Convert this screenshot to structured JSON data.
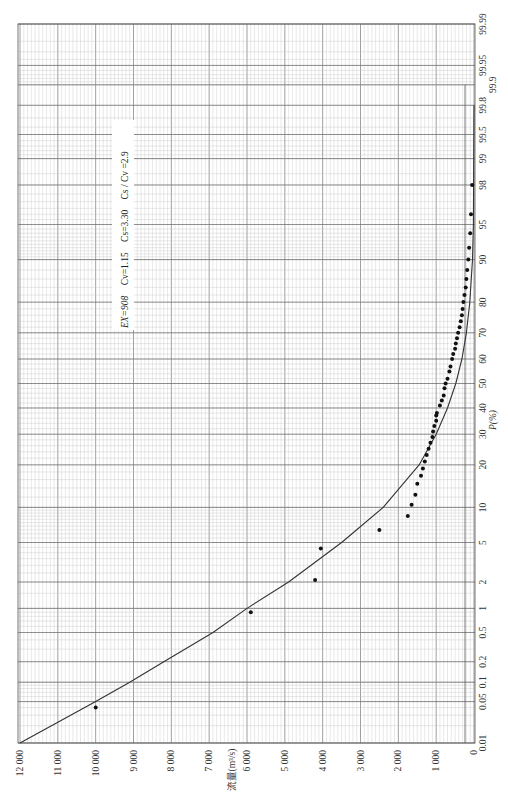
{
  "chart_data": {
    "type": "scatter",
    "title": "",
    "orientation": "rotated-90",
    "xlabel": "P(%)",
    "ylabel": "流量(m³/s)",
    "x_scale": "normal-probability",
    "x_ticks": [
      "0.01",
      "0.05",
      "0.1",
      "0.2",
      "0.5",
      "1",
      "2",
      "5",
      "10",
      "20",
      "30",
      "40",
      "50",
      "60",
      "70",
      "80",
      "90",
      "95",
      "98",
      "99",
      "99.5",
      "99.8",
      "99.9",
      "99.95",
      "99.99"
    ],
    "y_ticks": [
      "0",
      "1 000",
      "2 000",
      "3 000",
      "4 000",
      "5 000",
      "6 000",
      "7 000",
      "8 000",
      "9 000",
      "10 000",
      "11 000",
      "12 000"
    ],
    "ylim": [
      0,
      12000
    ],
    "xlim": [
      0.01,
      99.99
    ],
    "grid": true,
    "annotation": {
      "ex": "EX=908",
      "cv": "Cv=1.15",
      "cs": "Cs=3.30",
      "ratio": "Cs / Cv =2.9"
    },
    "series": [
      {
        "name": "observed",
        "kind": "points",
        "x": [
          0.04,
          0.9,
          2.1,
          4.4,
          6.5,
          8.5,
          10.5,
          12.5,
          15,
          17,
          19,
          21,
          23,
          25,
          27,
          29,
          31,
          33,
          35,
          37,
          38,
          41,
          43,
          45,
          48,
          50,
          52,
          55,
          57,
          60,
          62,
          64,
          66,
          68,
          70,
          72,
          74,
          76,
          78,
          80,
          82,
          84,
          86,
          88,
          90,
          92,
          94,
          96,
          98
        ],
        "y": [
          10000,
          5900,
          4200,
          4050,
          2500,
          1750,
          1650,
          1550,
          1500,
          1400,
          1350,
          1300,
          1250,
          1200,
          1150,
          1100,
          1080,
          1050,
          1000,
          1000,
          980,
          900,
          850,
          800,
          780,
          750,
          700,
          650,
          620,
          580,
          550,
          500,
          480,
          450,
          420,
          380,
          350,
          320,
          300,
          280,
          250,
          220,
          200,
          180,
          150,
          130,
          100,
          80,
          50
        ]
      },
      {
        "name": "P-III frequency curve",
        "kind": "line",
        "x": [
          0.01,
          0.05,
          0.1,
          0.2,
          0.5,
          1,
          2,
          5,
          10,
          20,
          30,
          40,
          50,
          60,
          70,
          80,
          90,
          95,
          99.8
        ],
        "y": [
          12000,
          10000,
          9100,
          8200,
          6900,
          6000,
          4900,
          3500,
          2400,
          1450,
          1000,
          700,
          480,
          320,
          200,
          110,
          40,
          15,
          0
        ]
      }
    ]
  }
}
